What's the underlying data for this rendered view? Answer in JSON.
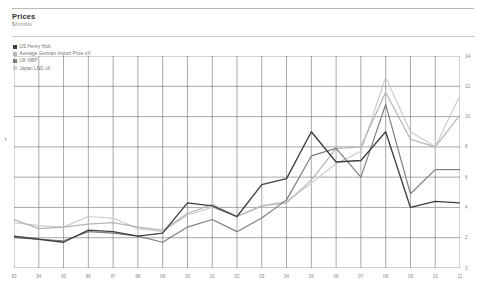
{
  "header": {
    "title": "Prices",
    "subtitle": "$/mmbtu"
  },
  "legend": {
    "position": "top-left",
    "items": [
      {
        "label": "US Henry Hub",
        "color": "#404040"
      },
      {
        "label": "Average German Import Price cif",
        "color": "#b4b4b4"
      },
      {
        "label": "UK NBP",
        "color": "#7f7f7f"
      },
      {
        "label": "Japan LNG cif",
        "color": "#cccccc"
      }
    ]
  },
  "axes": {
    "y_ticks": [
      "0",
      "2",
      "4",
      "6",
      "8",
      "10",
      "12",
      "14"
    ],
    "y_label_left": "t",
    "x_ticks": [
      "93",
      "94",
      "95",
      "96",
      "97",
      "98",
      "99",
      "00",
      "01",
      "02",
      "03",
      "04",
      "05",
      "06",
      "07",
      "08",
      "09",
      "10",
      "11"
    ]
  },
  "chart_data": {
    "type": "line",
    "title": "Prices",
    "subtitle": "$/mmbtu",
    "xlabel": "",
    "ylabel": "$/mmbtu",
    "ylim": [
      0,
      14
    ],
    "ytick_step": 2,
    "grid": true,
    "legend_position": "top-left",
    "axis_side": "right",
    "categories": [
      "93",
      "94",
      "95",
      "96",
      "97",
      "98",
      "99",
      "00",
      "01",
      "02",
      "03",
      "04",
      "05",
      "06",
      "07",
      "08",
      "09",
      "10",
      "11"
    ],
    "series": [
      {
        "name": "US Henry Hub",
        "color": "#404040",
        "values": [
          2.1,
          1.9,
          1.7,
          2.5,
          2.4,
          2.1,
          2.3,
          4.3,
          4.1,
          3.4,
          5.5,
          5.9,
          9.0,
          7.0,
          7.1,
          9.0,
          4.0,
          4.4,
          4.3
        ]
      },
      {
        "name": "Average German Import Price cif",
        "color": "#b4b4b4",
        "values": [
          3.2,
          2.6,
          2.7,
          2.9,
          3.0,
          2.7,
          2.5,
          3.6,
          4.2,
          3.4,
          4.1,
          4.3,
          5.8,
          7.9,
          8.0,
          11.6,
          8.5,
          8.0,
          10.1
        ]
      },
      {
        "name": "UK NBP",
        "color": "#7f7f7f",
        "values": [
          2.0,
          1.9,
          1.8,
          2.4,
          2.3,
          2.1,
          1.7,
          2.7,
          3.2,
          2.4,
          3.3,
          4.5,
          7.4,
          7.9,
          6.0,
          10.8,
          4.9,
          6.5,
          6.5
        ]
      },
      {
        "name": "Japan LNG cif",
        "color": "#cccccc",
        "values": [
          3.0,
          2.8,
          2.7,
          3.4,
          3.3,
          2.6,
          2.4,
          3.5,
          4.0,
          3.4,
          4.1,
          4.4,
          5.6,
          6.9,
          7.7,
          12.6,
          9.0,
          8.0,
          11.4
        ]
      }
    ]
  }
}
